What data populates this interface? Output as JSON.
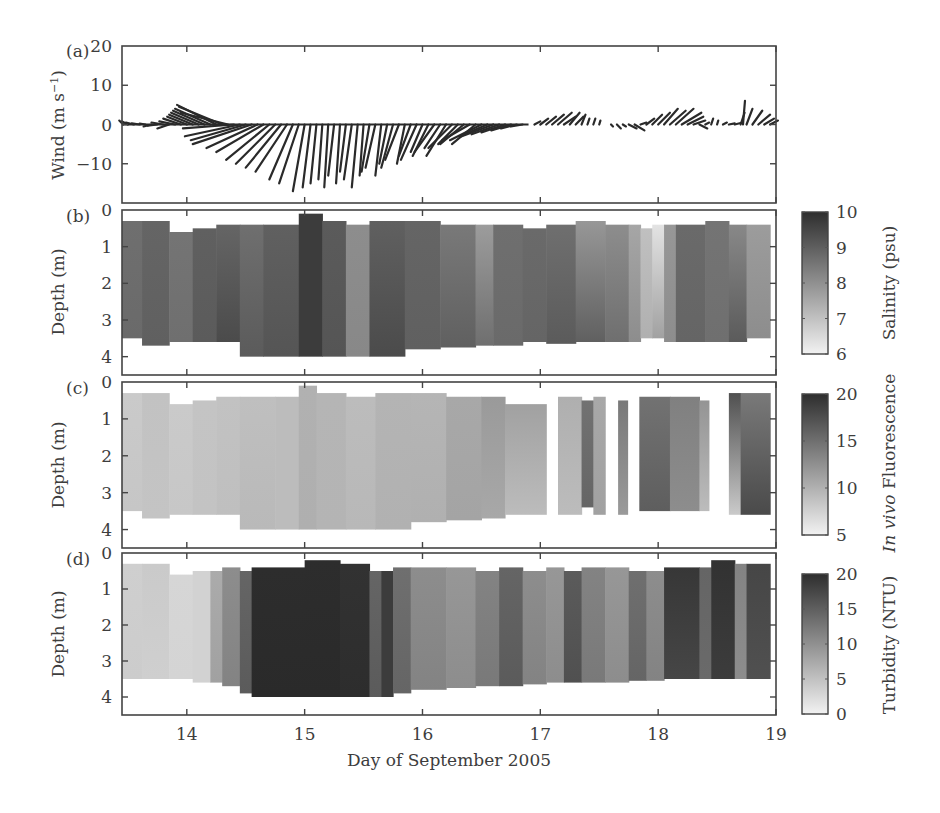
{
  "figure": {
    "xlabel": "Day of September 2005",
    "x_ticks": [
      14,
      15,
      16,
      17,
      18,
      19
    ],
    "x_range": [
      13.45,
      19.0
    ]
  },
  "chart_data": [
    {
      "panel": "(a)",
      "type": "line",
      "subtype": "stick-vector",
      "ylabel": "Wind (m s⁻¹)",
      "ylim": [
        -20,
        20
      ],
      "y_ticks": [
        20,
        10,
        0,
        -10
      ],
      "xlabel": "Day of September 2005",
      "columns": [
        "day",
        "u",
        "v"
      ],
      "sticks": [
        [
          13.46,
          -1,
          1
        ],
        [
          13.5,
          -1.5,
          0.8
        ],
        [
          13.55,
          -2,
          0.5
        ],
        [
          13.6,
          -2,
          0.3
        ],
        [
          13.65,
          -1.5,
          0.2
        ],
        [
          13.7,
          -2,
          -0.5
        ],
        [
          13.75,
          -2.5,
          -0.3
        ],
        [
          13.8,
          -3,
          0.5
        ],
        [
          13.85,
          -3,
          -1
        ],
        [
          13.9,
          -4,
          0.8
        ],
        [
          13.95,
          -4.5,
          1.5
        ],
        [
          14.0,
          -5,
          2
        ],
        [
          14.05,
          -6,
          2.5
        ],
        [
          14.1,
          -7,
          3
        ],
        [
          14.15,
          -8,
          3.5
        ],
        [
          14.2,
          -9,
          4
        ],
        [
          14.25,
          -10,
          5
        ],
        [
          14.3,
          -11,
          4.5
        ],
        [
          14.35,
          -12,
          3
        ],
        [
          14.4,
          -13,
          -1
        ],
        [
          14.45,
          -14,
          -3
        ],
        [
          14.5,
          -14,
          -4
        ],
        [
          14.55,
          -15,
          -5
        ],
        [
          14.6,
          -13,
          -6
        ],
        [
          14.65,
          -12,
          -7
        ],
        [
          14.7,
          -11,
          -9
        ],
        [
          14.75,
          -10,
          -10
        ],
        [
          14.8,
          -9,
          -11
        ],
        [
          14.85,
          -8,
          -12
        ],
        [
          14.9,
          -6,
          -14
        ],
        [
          14.95,
          -5,
          -15
        ],
        [
          15.0,
          -3,
          -17
        ],
        [
          15.05,
          -2,
          -16
        ],
        [
          15.1,
          -1.5,
          -15
        ],
        [
          15.15,
          -1,
          -14
        ],
        [
          15.2,
          -1,
          -16
        ],
        [
          15.25,
          -1.5,
          -13
        ],
        [
          15.3,
          -1,
          -15
        ],
        [
          15.35,
          -1.5,
          -12
        ],
        [
          15.4,
          -2,
          -14
        ],
        [
          15.45,
          -1.5,
          -16
        ],
        [
          15.5,
          -1,
          -13
        ],
        [
          15.55,
          -2,
          -12
        ],
        [
          15.6,
          -2.5,
          -11
        ],
        [
          15.65,
          -1.5,
          -13
        ],
        [
          15.7,
          -2,
          -10
        ],
        [
          15.75,
          -3,
          -11
        ],
        [
          15.8,
          -3.5,
          -9
        ],
        [
          15.85,
          -2,
          -10
        ],
        [
          15.9,
          -3,
          -8
        ],
        [
          15.95,
          -4,
          -9
        ],
        [
          16.0,
          -3,
          -7
        ],
        [
          16.05,
          -4,
          -8
        ],
        [
          16.1,
          -5,
          -7
        ],
        [
          16.15,
          -4,
          -6
        ],
        [
          16.2,
          -5,
          -8
        ],
        [
          16.25,
          -6,
          -6
        ],
        [
          16.3,
          -5,
          -5
        ],
        [
          16.35,
          -6,
          -5
        ],
        [
          16.4,
          -7,
          -4
        ],
        [
          16.45,
          -6,
          -5
        ],
        [
          16.5,
          -8,
          -4
        ],
        [
          16.55,
          -7,
          -3
        ],
        [
          16.6,
          -8,
          -3
        ],
        [
          16.65,
          -7,
          -2.5
        ],
        [
          16.7,
          -6,
          -2
        ],
        [
          16.75,
          -5,
          -1.5
        ],
        [
          16.8,
          -4,
          -1
        ],
        [
          16.85,
          -3,
          -0.5
        ],
        [
          16.95,
          1.5,
          0.8
        ],
        [
          17.0,
          2,
          1.5
        ],
        [
          17.05,
          2.5,
          2
        ],
        [
          17.1,
          3,
          2.5
        ],
        [
          17.15,
          3.5,
          3
        ],
        [
          17.2,
          3,
          2
        ],
        [
          17.25,
          2.5,
          3
        ],
        [
          17.3,
          2,
          2
        ],
        [
          17.35,
          1,
          2.5
        ],
        [
          17.4,
          0.5,
          1.5
        ],
        [
          17.45,
          0.5,
          1.5
        ],
        [
          17.5,
          0.3,
          1
        ],
        [
          17.6,
          0.5,
          -0.5
        ],
        [
          17.65,
          1,
          -1
        ],
        [
          17.7,
          0.8,
          -0.5
        ],
        [
          17.75,
          2,
          -1
        ],
        [
          17.8,
          2.5,
          -1.5
        ],
        [
          17.85,
          1.5,
          0.5
        ],
        [
          17.9,
          2,
          1.5
        ],
        [
          17.95,
          2.5,
          2.5
        ],
        [
          18.0,
          3,
          3
        ],
        [
          18.05,
          3.5,
          4
        ],
        [
          18.1,
          4,
          3.5
        ],
        [
          18.15,
          4.5,
          4
        ],
        [
          18.2,
          5,
          3
        ],
        [
          18.25,
          4,
          2
        ],
        [
          18.3,
          3,
          1
        ],
        [
          18.35,
          2,
          -1
        ],
        [
          18.4,
          1,
          0.5
        ],
        [
          18.45,
          0.5,
          1.5
        ],
        [
          18.5,
          0.3,
          1
        ],
        [
          18.55,
          1,
          0.5
        ],
        [
          18.6,
          1.5,
          0.3
        ],
        [
          18.65,
          2,
          0.5
        ],
        [
          18.7,
          1,
          3
        ],
        [
          18.72,
          0.5,
          6
        ],
        [
          18.75,
          1.5,
          4
        ],
        [
          18.8,
          2.5,
          3.5
        ],
        [
          18.85,
          3,
          2.5
        ],
        [
          18.9,
          2.5,
          1.5
        ],
        [
          18.95,
          2,
          1
        ]
      ]
    },
    {
      "panel": "(b)",
      "type": "heatmap",
      "ylabel": "Depth (m)",
      "ylim": [
        4.5,
        0
      ],
      "y_ticks": [
        0,
        1,
        2,
        3,
        4
      ],
      "colorbar": {
        "label": "Salinity (psu)",
        "ticks": [
          10,
          9,
          8,
          7,
          6
        ],
        "range": [
          6,
          10
        ]
      },
      "columns": [
        "day_start",
        "day_end",
        "top_depth_m",
        "bottom_depth_m",
        "value_surface",
        "value_bottom"
      ],
      "segments": [
        [
          13.45,
          13.62,
          0.3,
          3.5,
          8.6,
          8.7
        ],
        [
          13.62,
          13.85,
          0.3,
          3.7,
          8.8,
          8.9
        ],
        [
          13.85,
          14.05,
          0.6,
          3.6,
          8.5,
          8.6
        ],
        [
          14.05,
          14.25,
          0.5,
          3.6,
          8.9,
          9.0
        ],
        [
          14.25,
          14.45,
          0.4,
          3.6,
          8.8,
          9.3
        ],
        [
          14.45,
          14.65,
          0.4,
          4.0,
          8.6,
          9.0
        ],
        [
          14.65,
          14.95,
          0.4,
          4.0,
          8.9,
          9.1
        ],
        [
          14.95,
          15.15,
          0.1,
          4.0,
          9.6,
          9.6
        ],
        [
          15.15,
          15.35,
          0.3,
          4.0,
          9.0,
          9.1
        ],
        [
          15.35,
          15.55,
          0.4,
          4.0,
          8.0,
          8.1
        ],
        [
          15.55,
          15.85,
          0.3,
          4.0,
          8.9,
          9.3
        ],
        [
          15.85,
          16.15,
          0.3,
          3.8,
          8.8,
          8.9
        ],
        [
          16.15,
          16.45,
          0.4,
          3.75,
          8.4,
          8.9
        ],
        [
          16.45,
          16.6,
          0.4,
          3.7,
          7.7,
          8.6
        ],
        [
          16.6,
          16.85,
          0.4,
          3.7,
          8.6,
          8.7
        ],
        [
          16.85,
          17.05,
          0.5,
          3.6,
          8.7,
          8.8
        ],
        [
          17.05,
          17.3,
          0.4,
          3.65,
          8.6,
          9.0
        ],
        [
          17.3,
          17.55,
          0.3,
          3.6,
          7.8,
          8.9
        ],
        [
          17.55,
          17.75,
          0.4,
          3.6,
          8.0,
          8.6
        ],
        [
          17.75,
          17.85,
          0.4,
          3.6,
          7.5,
          8.0
        ],
        [
          17.85,
          17.95,
          0.5,
          3.5,
          7.0,
          7.3
        ],
        [
          17.95,
          18.05,
          0.4,
          3.5,
          6.3,
          7.6
        ],
        [
          18.05,
          18.15,
          0.4,
          3.6,
          7.8,
          8.0
        ],
        [
          18.15,
          18.4,
          0.4,
          3.6,
          8.7,
          8.8
        ],
        [
          18.4,
          18.6,
          0.3,
          3.6,
          8.5,
          8.6
        ],
        [
          18.6,
          18.75,
          0.4,
          3.6,
          8.1,
          9.0
        ],
        [
          18.75,
          18.95,
          0.4,
          3.5,
          7.7,
          8.0
        ]
      ]
    },
    {
      "panel": "(c)",
      "type": "heatmap",
      "ylabel": "Depth (m)",
      "ylim": [
        4.5,
        0
      ],
      "y_ticks": [
        0,
        1,
        2,
        3,
        4
      ],
      "colorbar": {
        "label": "In vivo Fluorescence",
        "label_italic": "In vivo",
        "label_rest": " Fluorescence",
        "ticks": [
          20,
          15,
          10,
          5
        ],
        "range": [
          5,
          20
        ]
      },
      "columns": [
        "day_start",
        "day_end",
        "top_depth_m",
        "bottom_depth_m",
        "value_surface",
        "value_bottom"
      ],
      "segments": [
        [
          13.45,
          13.62,
          0.3,
          3.5,
          8.0,
          8.3
        ],
        [
          13.62,
          13.85,
          0.3,
          3.7,
          8.6,
          8.4
        ],
        [
          13.85,
          14.05,
          0.6,
          3.6,
          8.0,
          8.2
        ],
        [
          14.05,
          14.25,
          0.5,
          3.6,
          8.4,
          8.5
        ],
        [
          14.25,
          14.45,
          0.4,
          3.6,
          8.6,
          8.8
        ],
        [
          14.45,
          14.75,
          0.4,
          4.0,
          8.8,
          9.2
        ],
        [
          14.75,
          14.95,
          0.4,
          4.0,
          9.0,
          9.0
        ],
        [
          14.95,
          15.1,
          0.1,
          4.0,
          9.8,
          10.0
        ],
        [
          15.1,
          15.35,
          0.3,
          4.0,
          9.5,
          9.6
        ],
        [
          15.35,
          15.6,
          0.4,
          4.0,
          9.0,
          9.3
        ],
        [
          15.6,
          15.9,
          0.3,
          4.0,
          9.6,
          9.8
        ],
        [
          15.9,
          16.2,
          0.3,
          3.8,
          9.5,
          9.9
        ],
        [
          16.2,
          16.5,
          0.4,
          3.75,
          10.5,
          10.8
        ],
        [
          16.5,
          16.7,
          0.4,
          3.7,
          11.5,
          10.5
        ],
        [
          16.7,
          17.05,
          0.6,
          3.6,
          11.0,
          9.0
        ],
        [
          17.15,
          17.35,
          0.4,
          3.6,
          10.0,
          9.0
        ],
        [
          17.35,
          17.45,
          0.5,
          3.4,
          14.5,
          15.5
        ],
        [
          17.45,
          17.55,
          0.4,
          3.6,
          10.5,
          11.0
        ],
        [
          17.66,
          17.74,
          0.5,
          3.6,
          14.0,
          11.5
        ],
        [
          17.84,
          18.1,
          0.4,
          3.5,
          14.5,
          16.0
        ],
        [
          18.1,
          18.35,
          0.4,
          3.5,
          13.5,
          12.5
        ],
        [
          18.35,
          18.43,
          0.5,
          3.5,
          12.0,
          9.0
        ],
        [
          18.6,
          18.7,
          0.3,
          3.6,
          17.0,
          8.0
        ],
        [
          18.7,
          18.95,
          0.3,
          3.6,
          14.0,
          17.5
        ]
      ]
    },
    {
      "panel": "(d)",
      "type": "heatmap",
      "ylabel": "Depth (m)",
      "ylim": [
        4.5,
        0
      ],
      "y_ticks": [
        0,
        1,
        2,
        3,
        4
      ],
      "colorbar": {
        "label": "Turbidity (NTU)",
        "ticks": [
          20,
          15,
          10,
          5,
          0
        ],
        "range": [
          0,
          20
        ]
      },
      "columns": [
        "day_start",
        "day_end",
        "top_depth_m",
        "bottom_depth_m",
        "value_surface",
        "value_bottom"
      ],
      "segments": [
        [
          13.45,
          13.62,
          0.3,
          3.5,
          3.5,
          3.8
        ],
        [
          13.62,
          13.85,
          0.3,
          3.5,
          4.0,
          3.5
        ],
        [
          13.85,
          14.05,
          0.6,
          3.5,
          2.8,
          3.0
        ],
        [
          14.05,
          14.2,
          0.5,
          3.6,
          3.2,
          3.2
        ],
        [
          14.2,
          14.3,
          0.5,
          3.6,
          7.0,
          8.0
        ],
        [
          14.3,
          14.45,
          0.4,
          3.7,
          10.0,
          11.0
        ],
        [
          14.45,
          14.55,
          0.5,
          3.9,
          14.0,
          15.0
        ],
        [
          14.55,
          15.0,
          0.4,
          4.0,
          19.5,
          19.8
        ],
        [
          15.0,
          15.3,
          0.2,
          4.0,
          19.5,
          19.8
        ],
        [
          15.3,
          15.55,
          0.3,
          4.0,
          19.0,
          19.5
        ],
        [
          15.55,
          15.65,
          0.5,
          4.0,
          14.0,
          15.0
        ],
        [
          15.65,
          15.75,
          0.5,
          4.0,
          18.0,
          18.0
        ],
        [
          15.75,
          15.9,
          0.4,
          3.9,
          13.0,
          14.0
        ],
        [
          15.9,
          16.2,
          0.4,
          3.8,
          10.0,
          11.0
        ],
        [
          16.2,
          16.45,
          0.4,
          3.75,
          9.0,
          10.0
        ],
        [
          16.45,
          16.65,
          0.5,
          3.7,
          11.0,
          12.0
        ],
        [
          16.65,
          16.85,
          0.4,
          3.7,
          14.0,
          15.0
        ],
        [
          16.85,
          17.05,
          0.5,
          3.65,
          10.0,
          11.0
        ],
        [
          17.05,
          17.2,
          0.4,
          3.6,
          9.0,
          10.0
        ],
        [
          17.2,
          17.35,
          0.5,
          3.6,
          15.0,
          16.0
        ],
        [
          17.35,
          17.55,
          0.4,
          3.6,
          11.0,
          12.0
        ],
        [
          17.55,
          17.75,
          0.4,
          3.6,
          9.0,
          10.0
        ],
        [
          17.75,
          17.9,
          0.5,
          3.55,
          13.0,
          14.0
        ],
        [
          17.9,
          18.05,
          0.5,
          3.55,
          10.0,
          11.0
        ],
        [
          18.05,
          18.35,
          0.4,
          3.5,
          18.5,
          17.0
        ],
        [
          18.35,
          18.45,
          0.4,
          3.5,
          14.0,
          13.5
        ],
        [
          18.45,
          18.65,
          0.2,
          3.5,
          19.0,
          18.0
        ],
        [
          18.65,
          18.75,
          0.3,
          3.5,
          11.0,
          10.0
        ],
        [
          18.75,
          18.95,
          0.3,
          3.5,
          17.0,
          16.0
        ]
      ]
    }
  ],
  "panels": {
    "a": {
      "tag": "(a)",
      "ylabel": "Wind (m s",
      "ylabel_sup": "−1",
      "ylabel_end": ")"
    },
    "b": {
      "tag": "(b)",
      "ylabel": "Depth (m)",
      "cbar_label": "Salinity (psu)"
    },
    "c": {
      "tag": "(c)",
      "ylabel": "Depth (m)",
      "cbar_label_italic": "In vivo",
      "cbar_label_rest": " Fluorescence"
    },
    "d": {
      "tag": "(d)",
      "ylabel": "Depth (m)",
      "cbar_label": "Turbidity (NTU)"
    }
  }
}
